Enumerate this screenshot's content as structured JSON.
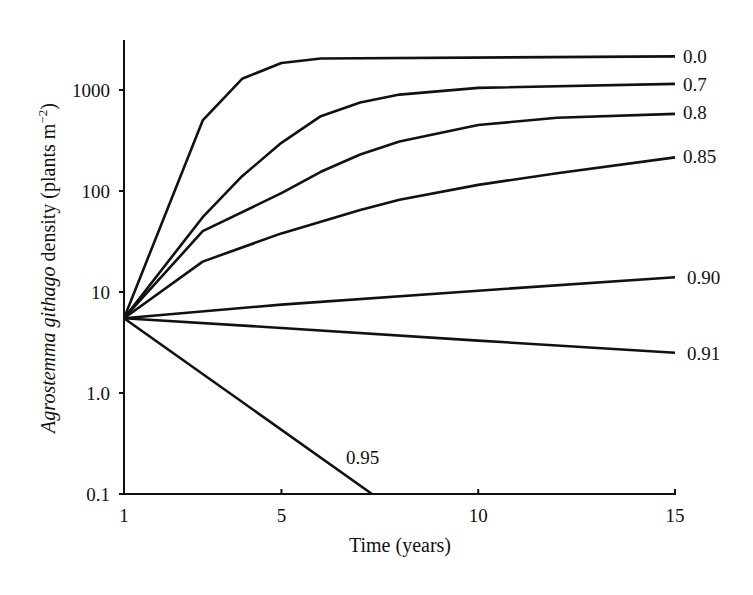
{
  "chart_data": {
    "type": "line",
    "title": "",
    "xlabel": "Time (years)",
    "ylabel_italic": "Agrostemma githago",
    "ylabel_rest": " density (plants m",
    "ylabel_sup": "−2",
    "ylabel_close": ")",
    "yscale": "log",
    "xlim": [
      1,
      15
    ],
    "ylim": [
      0.1,
      3000
    ],
    "xticks": [
      1,
      5,
      10,
      15
    ],
    "xtick_labels": [
      "1",
      "5",
      "10",
      "15"
    ],
    "yticks": [
      0.1,
      1,
      10,
      100,
      1000
    ],
    "ytick_labels": [
      "0.1",
      "1.0",
      "10",
      "100",
      "1000"
    ],
    "grid": false,
    "legend": "inline labels at line ends",
    "series": [
      {
        "name": "0.0",
        "x": [
          1,
          3,
          4,
          5,
          6,
          15
        ],
        "y": [
          5.5,
          500,
          1290,
          1850,
          2050,
          2150
        ]
      },
      {
        "name": "0.7",
        "x": [
          1,
          3,
          4,
          5,
          6,
          7,
          8,
          10,
          15
        ],
        "y": [
          5.5,
          55,
          140,
          300,
          550,
          750,
          900,
          1050,
          1150
        ]
      },
      {
        "name": "0.8",
        "x": [
          1,
          3,
          5,
          6,
          7,
          8,
          10,
          12,
          15
        ],
        "y": [
          5.5,
          40,
          95,
          155,
          230,
          310,
          450,
          530,
          580
        ]
      },
      {
        "name": "0.85",
        "x": [
          1,
          3,
          5,
          7,
          8,
          10,
          12,
          15
        ],
        "y": [
          5.5,
          20,
          38,
          65,
          82,
          115,
          150,
          215
        ]
      },
      {
        "name": "0.90",
        "x": [
          1,
          5,
          10,
          15
        ],
        "y": [
          5.5,
          7.5,
          10.3,
          14
        ]
      },
      {
        "name": "0.91",
        "x": [
          1,
          5,
          10,
          15
        ],
        "y": [
          5.5,
          4.4,
          3.3,
          2.5
        ]
      },
      {
        "name": "0.95",
        "x": [
          1,
          7.3
        ],
        "y": [
          5.5,
          0.1
        ]
      }
    ],
    "series_label_positions": [
      {
        "name": "0.0",
        "x": 683,
        "y": 63
      },
      {
        "name": "0.7",
        "x": 683,
        "y": 91
      },
      {
        "name": "0.8",
        "x": 683,
        "y": 119
      },
      {
        "name": "0.85",
        "x": 683,
        "y": 163
      },
      {
        "name": "0.90",
        "x": 687,
        "y": 284
      },
      {
        "name": "0.91",
        "x": 687,
        "y": 360
      },
      {
        "name": "0.95",
        "x": 346,
        "y": 464
      }
    ]
  }
}
